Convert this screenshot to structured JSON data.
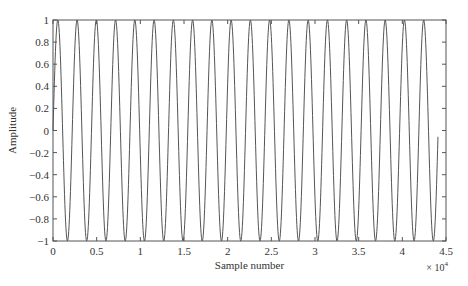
{
  "chart_data": {
    "type": "line",
    "title": "",
    "xlabel": "Sample number",
    "ylabel": "Amplitude",
    "x_scale_label": "× 10",
    "x_scale_exponent": "4",
    "xlim": [
      0,
      45000
    ],
    "ylim": [
      -1,
      1
    ],
    "grid": false,
    "legend": null,
    "x_ticks": [
      0,
      5000,
      10000,
      15000,
      20000,
      25000,
      30000,
      35000,
      40000,
      45000
    ],
    "x_tick_labels": [
      "0",
      "0.5",
      "1",
      "1.5",
      "2",
      "2.5",
      "3",
      "3.5",
      "4",
      "4.5"
    ],
    "y_ticks": [
      -1,
      -0.8,
      -0.6,
      -0.4,
      -0.2,
      0,
      0.2,
      0.4,
      0.6,
      0.8,
      1
    ],
    "y_tick_labels": [
      "−1",
      "−0.8",
      "−0.6",
      "−0.4",
      "−0.2",
      "0",
      "0.2",
      "0.4",
      "0.6",
      "0.8",
      "1"
    ],
    "series": [
      {
        "name": "sine wave",
        "function": "sin(2*pi*f*n/fs)",
        "frequency_hz": 20,
        "sample_rate": 44100,
        "n_start": 0,
        "n_end": 44100,
        "amplitude": 1,
        "color": "#555555"
      }
    ]
  }
}
